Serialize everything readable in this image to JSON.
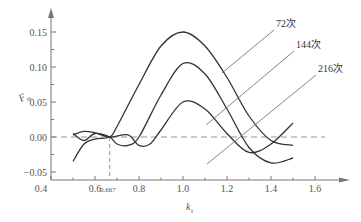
{
  "chart_data": {
    "type": "line",
    "title": "",
    "xlabel": "k_i",
    "ylabel": "F_m",
    "xlim": [
      0.4,
      1.75
    ],
    "ylim": [
      -0.05,
      0.17
    ],
    "x_ticks": [
      0.4,
      0.6,
      0.8,
      1.0,
      1.2,
      1.4,
      1.6
    ],
    "x_tick_labels": [
      "0.4",
      "0.6",
      "0.8",
      "1.0",
      "1.2",
      "1.4",
      "1.6"
    ],
    "y_ticks": [
      -0.05,
      0.0,
      0.05,
      0.1,
      0.15
    ],
    "y_tick_labels": [
      "−0.05",
      "0.00",
      "0.05",
      "0.10",
      "0.15"
    ],
    "annotations": [
      {
        "text": "0.667",
        "x": 0.667,
        "note": "dashed vertical reference line at k_i = 0.667"
      },
      {
        "text": "dashed horizontal reference line at F_m = 0",
        "y": 0.0
      }
    ],
    "grid": false,
    "legend": "inline labels with leader lines",
    "series": [
      {
        "name": "72次",
        "x": [
          0.5,
          0.55,
          0.6,
          0.667,
          0.7,
          0.8,
          0.9,
          1.0,
          1.1,
          1.2,
          1.3,
          1.4,
          1.5
        ],
        "y": [
          -0.035,
          -0.01,
          -0.003,
          0.0,
          0.015,
          0.075,
          0.13,
          0.15,
          0.13,
          0.085,
          0.03,
          -0.005,
          -0.012
        ]
      },
      {
        "name": "144次",
        "x": [
          0.5,
          0.55,
          0.6,
          0.667,
          0.7,
          0.75,
          0.8,
          0.9,
          1.0,
          1.1,
          1.2,
          1.3,
          1.4,
          1.5
        ],
        "y": [
          0.005,
          -0.005,
          0.005,
          0.0,
          -0.01,
          -0.012,
          0.0,
          0.06,
          0.105,
          0.09,
          0.04,
          -0.015,
          -0.037,
          -0.03
        ]
      },
      {
        "name": "216次",
        "x": [
          0.5,
          0.55,
          0.6,
          0.667,
          0.75,
          0.8,
          0.85,
          0.9,
          1.0,
          1.1,
          1.2,
          1.3,
          1.4,
          1.5
        ],
        "y": [
          0.003,
          0.008,
          0.006,
          0.0,
          0.003,
          -0.012,
          -0.01,
          0.01,
          0.05,
          0.04,
          0.005,
          -0.022,
          -0.01,
          0.02
        ]
      }
    ]
  },
  "labels": {
    "x_axis_title_main": "k",
    "x_axis_title_sub": "i",
    "y_axis_title_main": "F",
    "y_axis_title_sub": "m",
    "ref_x_label": "0.667",
    "curve_72": "72次",
    "curve_144": "144次",
    "curve_216": "216次"
  },
  "colors": {
    "axis": "#777777",
    "curve": "#333333",
    "leader": "#666666",
    "reference": "#888888"
  }
}
